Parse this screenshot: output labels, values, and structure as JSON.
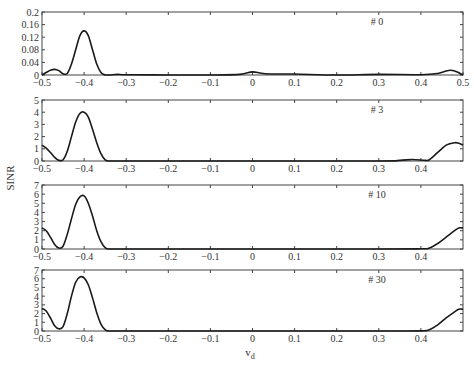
{
  "chart_data": [
    {
      "type": "line",
      "panel_label": "# 0",
      "ylim": [
        0,
        0.2
      ],
      "yticks": [
        0,
        0.04,
        0.08,
        0.12,
        0.16,
        0.2
      ],
      "ytick_labels": [
        "0",
        "0.04",
        "0.08",
        "0.12",
        "0.16",
        "0.2"
      ],
      "xlim": [
        -0.5,
        0.5
      ],
      "xticks": [
        -0.5,
        -0.4,
        -0.3,
        -0.2,
        -0.1,
        0,
        0.1,
        0.2,
        0.3,
        0.4,
        0.5
      ],
      "xtick_labels": [
        "-0.5",
        "-0.4",
        "-0.3",
        "-0.2",
        "-0.1",
        "0",
        "0.1",
        "0.2",
        "0.3",
        "0.4",
        "0.5"
      ],
      "x": [
        -0.5,
        -0.49,
        -0.48,
        -0.47,
        -0.46,
        -0.45,
        -0.44,
        -0.43,
        -0.42,
        -0.41,
        -0.4,
        -0.39,
        -0.38,
        -0.37,
        -0.36,
        -0.35,
        -0.34,
        -0.32,
        -0.3,
        -0.2,
        -0.1,
        -0.03,
        0,
        0.03,
        0.1,
        0.2,
        0.3,
        0.4,
        0.44,
        0.46,
        0.47,
        0.48,
        0.49,
        0.5
      ],
      "values": [
        0,
        0.008,
        0.015,
        0.018,
        0.014,
        0.004,
        0.005,
        0.035,
        0.08,
        0.125,
        0.14,
        0.125,
        0.08,
        0.035,
        0.008,
        0,
        0,
        0.002,
        0.001,
        0,
        0,
        0.002,
        0.01,
        0.004,
        0.003,
        0,
        0.002,
        0.001,
        0.005,
        0.013,
        0.015,
        0.013,
        0.007,
        0
      ]
    },
    {
      "type": "line",
      "panel_label": "# 3",
      "ylim": [
        0,
        5
      ],
      "yticks": [
        0,
        1,
        2,
        3,
        4,
        5
      ],
      "ytick_labels": [
        "0",
        "1",
        "2",
        "3",
        "4",
        "5"
      ],
      "xlim": [
        -0.5,
        0.5
      ],
      "xticks": [
        -0.5,
        -0.4,
        -0.3,
        -0.2,
        -0.1,
        0,
        0.1,
        0.2,
        0.3,
        0.4
      ],
      "xtick_labels": [
        "-0.5",
        "-0.4",
        "-0.3",
        "-0.2",
        "-0.1",
        "0",
        "0.1",
        "0.2",
        "0.3",
        "0.4"
      ],
      "x": [
        -0.5,
        -0.49,
        -0.48,
        -0.47,
        -0.46,
        -0.45,
        -0.44,
        -0.43,
        -0.42,
        -0.41,
        -0.4,
        -0.39,
        -0.38,
        -0.37,
        -0.36,
        -0.35,
        -0.34,
        -0.3,
        0,
        0.3,
        0.35,
        0.38,
        0.41,
        0.42,
        0.44,
        0.46,
        0.48,
        0.49,
        0.5
      ],
      "values": [
        1.3,
        1.05,
        0.7,
        0.3,
        0.05,
        0.1,
        0.8,
        2.0,
        3.2,
        3.9,
        4.0,
        3.6,
        2.6,
        1.5,
        0.6,
        0.1,
        0,
        0,
        0,
        0,
        0.05,
        0.12,
        0.05,
        0.1,
        0.7,
        1.3,
        1.5,
        1.45,
        1.3
      ]
    },
    {
      "type": "line",
      "panel_label": "# 10",
      "ylim": [
        0,
        7
      ],
      "yticks": [
        0,
        1,
        2,
        3,
        4,
        5,
        6,
        7
      ],
      "ytick_labels": [
        "0",
        "1",
        "2",
        "3",
        "4",
        "5",
        "6",
        "7"
      ],
      "xlim": [
        -0.5,
        0.5
      ],
      "xticks": [
        -0.5,
        -0.4,
        -0.3,
        -0.2,
        -0.1,
        0,
        0.1,
        0.2,
        0.3,
        0.4
      ],
      "xtick_labels": [
        "-0.5",
        "-0.4",
        "-0.3",
        "-0.2",
        "-0.1",
        "0",
        "0.1",
        "0.2",
        "0.3",
        "0.4"
      ],
      "x": [
        -0.5,
        -0.49,
        -0.48,
        -0.47,
        -0.46,
        -0.45,
        -0.44,
        -0.43,
        -0.42,
        -0.41,
        -0.4,
        -0.39,
        -0.38,
        -0.37,
        -0.36,
        -0.35,
        -0.34,
        -0.3,
        0,
        0.3,
        0.4,
        0.42,
        0.44,
        0.46,
        0.48,
        0.49,
        0.5
      ],
      "values": [
        2.3,
        2.0,
        1.3,
        0.5,
        0.1,
        0.3,
        1.6,
        3.3,
        4.9,
        5.7,
        5.8,
        5.0,
        3.6,
        2.0,
        0.8,
        0.15,
        0,
        0,
        0,
        0,
        0.02,
        0.1,
        0.6,
        1.3,
        2.0,
        2.3,
        2.3
      ]
    },
    {
      "type": "line",
      "panel_label": "# 30",
      "ylim": [
        0,
        7
      ],
      "yticks": [
        0,
        1,
        2,
        3,
        4,
        5,
        6,
        7
      ],
      "ytick_labels": [
        "0",
        "1",
        "2",
        "3",
        "4",
        "5",
        "6",
        "7"
      ],
      "xlim": [
        -0.5,
        0.5
      ],
      "xticks": [
        -0.5,
        -0.4,
        -0.3,
        -0.2,
        -0.1,
        0,
        0.1,
        0.2,
        0.3,
        0.4
      ],
      "xtick_labels": [
        "-0.5",
        "-0.4",
        "-0.3",
        "-0.2",
        "-0.1",
        "0",
        "0.1",
        "0.2",
        "0.3",
        "0.4"
      ],
      "x": [
        -0.5,
        -0.49,
        -0.48,
        -0.47,
        -0.46,
        -0.45,
        -0.44,
        -0.43,
        -0.42,
        -0.41,
        -0.4,
        -0.39,
        -0.38,
        -0.37,
        -0.36,
        -0.35,
        -0.34,
        -0.3,
        0,
        0.3,
        0.4,
        0.42,
        0.44,
        0.46,
        0.48,
        0.49,
        0.5
      ],
      "values": [
        2.6,
        2.3,
        1.5,
        0.6,
        0.25,
        0.5,
        2.0,
        4.0,
        5.6,
        6.2,
        6.1,
        5.3,
        3.8,
        2.1,
        0.8,
        0.15,
        0,
        0,
        0,
        0,
        0.02,
        0.15,
        0.7,
        1.5,
        2.2,
        2.5,
        2.5
      ]
    }
  ],
  "labels": {
    "ylabel": "SINR",
    "xlabel": "v",
    "xlabel_subscript": "d"
  }
}
